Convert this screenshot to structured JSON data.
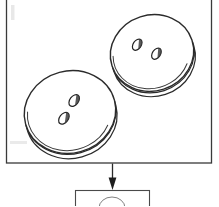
{
  "figure": {
    "type": "line-drawing-diagram",
    "background_color": "#ffffff",
    "stroke_color": "#1a1a1a",
    "fill_color": "#ffffff"
  },
  "main_frame": {
    "label": "main-panel",
    "x": 6,
    "y": -2,
    "width": 206,
    "height": 165,
    "stroke_width": 1.2
  },
  "buttons": [
    {
      "name": "button-upper-right",
      "holes": 2,
      "center_x": 152,
      "center_y": 53,
      "radius_x": 42,
      "radius_y": 38,
      "rotation_deg": -18,
      "rim_offset": 5,
      "hole_positions": [
        {
          "cx": 141,
          "cy": 44,
          "rx": 6,
          "ry": 4,
          "rot": -35
        },
        {
          "cx": 155,
          "cy": 56,
          "rx": 6,
          "ry": 4,
          "rot": -35
        }
      ]
    },
    {
      "name": "button-lower-left",
      "holes": 2,
      "center_x": 70,
      "center_y": 112,
      "radius_x": 46,
      "radius_y": 41,
      "rotation_deg": -15,
      "rim_offset": 6,
      "hole_positions": [
        {
          "cx": 78,
          "cy": 104,
          "rx": 6.5,
          "ry": 4.5,
          "rot": -35
        },
        {
          "cx": 64,
          "cy": 117,
          "rx": 6.5,
          "ry": 4.5,
          "rot": -35
        }
      ]
    }
  ],
  "arrow": {
    "name": "flow-arrow-down",
    "x": 112,
    "y_start": 163,
    "y_end": 189,
    "head_width": 7,
    "head_height": 10
  },
  "lower_box": {
    "name": "lower-panel-cropped",
    "x": 75,
    "y": 190,
    "width": 75,
    "height": 16,
    "clipped": true,
    "contains": "partial button outline"
  },
  "artifacts": [
    {
      "name": "scan-smudge-left-upper",
      "x": 10,
      "y": 6,
      "width": 5,
      "height": 14
    },
    {
      "name": "scan-smudge-left-lower",
      "x": 10,
      "y": 141,
      "width": 18,
      "height": 4
    },
    {
      "name": "scan-speck-center",
      "x": 92,
      "y": 132,
      "width": 3,
      "height": 3
    }
  ]
}
